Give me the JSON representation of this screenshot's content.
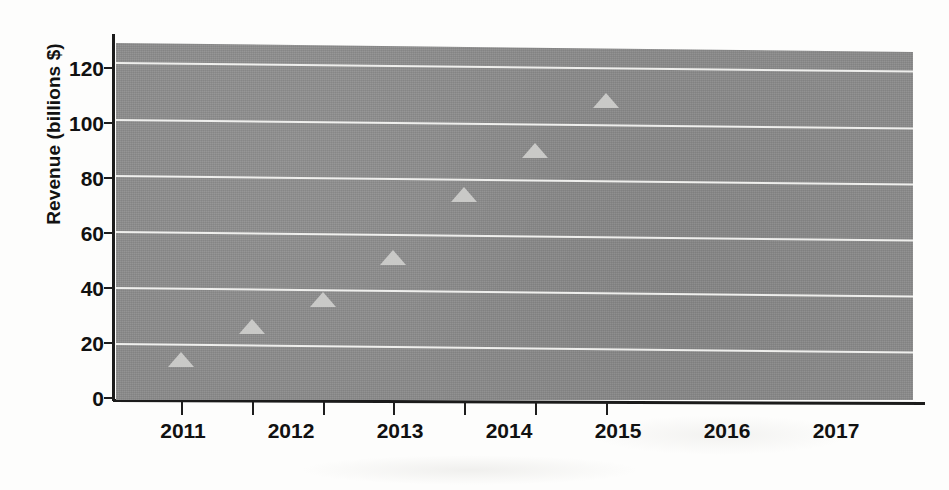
{
  "chart_data": {
    "type": "scatter",
    "title": "",
    "xlabel": "",
    "ylabel": "Revenue (billions $)",
    "categories": [
      "2011",
      "2012",
      "2013",
      "2014",
      "2015",
      "2016",
      "2017"
    ],
    "values": [
      14.5,
      26.5,
      36,
      51,
      73.5,
      89,
      107
    ],
    "x": [
      2011,
      2012,
      2013,
      2014,
      2015,
      2016,
      2017
    ],
    "series": [
      {
        "name": "Revenue",
        "values": [
          14.5,
          26.5,
          36,
          51,
          73.5,
          89,
          107
        ],
        "marker": "triangle-up",
        "marker_color": "#c9c9c7"
      }
    ],
    "ylim": [
      0,
      128
    ],
    "yticks": [
      0,
      20,
      40,
      60,
      80,
      100,
      120
    ],
    "ytick_labels": [
      "0",
      "20",
      "40",
      "60",
      "80",
      "100",
      "120"
    ],
    "xtick_labels": [
      "2011",
      "2012",
      "2013",
      "2014",
      "2015",
      "2016",
      "2017"
    ],
    "grid": true,
    "grid_axis": "y",
    "grid_color": "#f2f2f0",
    "legend": false,
    "legend_position": "none",
    "plot_background": "#8b8b8b",
    "figure_background": "#fdfdfc",
    "axis_color": "#1b1b1b",
    "text_color": "#111111"
  },
  "axes": {
    "y_title": "Revenue (billions $)",
    "y_ticks": [
      {
        "value": 120,
        "label": "120"
      },
      {
        "value": 100,
        "label": "100"
      },
      {
        "value": 80,
        "label": "80"
      },
      {
        "value": 60,
        "label": "60"
      },
      {
        "value": 40,
        "label": "40"
      },
      {
        "value": 20,
        "label": "20"
      },
      {
        "value": 0,
        "label": "0"
      }
    ],
    "x_ticks": [
      {
        "label": "2011"
      },
      {
        "label": "2012"
      },
      {
        "label": "2013"
      },
      {
        "label": "2014"
      },
      {
        "label": "2015"
      },
      {
        "label": "2016"
      },
      {
        "label": "2017"
      }
    ]
  }
}
